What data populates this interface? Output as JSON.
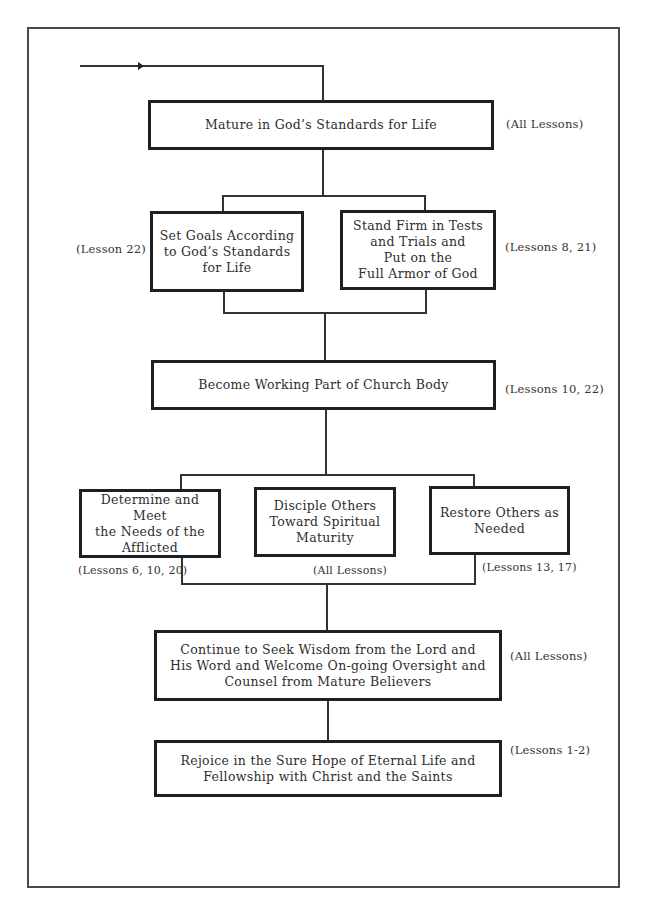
{
  "diagram": {
    "type": "flowchart",
    "entry_arrow": {
      "direction": "right"
    },
    "nodes": [
      {
        "id": "mature",
        "label": "Mature in God’s Standards for Life",
        "lines": [
          "Mature in God’s Standards for Life"
        ],
        "note": "(All Lessons)"
      },
      {
        "id": "set-goals",
        "label": "Set Goals According to God’s Standards for Life",
        "lines": [
          "Set Goals According",
          "to God’s Standards",
          "for Life"
        ],
        "note": "(Lesson 22)"
      },
      {
        "id": "stand-firm",
        "label": "Stand Firm in Tests and Trials and Put on the Full Armor of God",
        "lines": [
          "Stand Firm in Tests",
          "and Trials and",
          "Put on the",
          "Full Armor of God"
        ],
        "note": "(Lessons 8, 21)"
      },
      {
        "id": "church-body",
        "label": "Become Working Part of Church Body",
        "lines": [
          "Become Working Part of Church Body"
        ],
        "note": "(Lessons 10, 22)"
      },
      {
        "id": "afflicted",
        "label": "Determine and Meet the Needs of the Afflicted",
        "lines": [
          "Determine and Meet",
          "the Needs of the",
          "Afflicted"
        ],
        "note": "(Lessons 6, 10, 20)"
      },
      {
        "id": "disciple",
        "label": "Disciple Others Toward Spiritual Maturity",
        "lines": [
          "Disciple Others",
          "Toward Spiritual",
          "Maturity"
        ],
        "note": "(All Lessons)"
      },
      {
        "id": "restore",
        "label": "Restore Others as Needed",
        "lines": [
          "Restore Others as",
          "Needed"
        ],
        "note": "(Lessons 13, 17)"
      },
      {
        "id": "wisdom",
        "label": "Continue to Seek Wisdom from the Lord and His Word and Welcome On-going Oversight and Counsel from Mature Believers",
        "lines": [
          "Continue to Seek Wisdom from the Lord and",
          "His Word and Welcome On-going Oversight and",
          "Counsel from Mature Believers"
        ],
        "note": "(All Lessons)"
      },
      {
        "id": "rejoice",
        "label": "Rejoice in the Sure Hope of Eternal Life and Fellowship with Christ and the Saints",
        "lines": [
          "Rejoice in the Sure Hope of Eternal Life and",
          "Fellowship with Christ and the Saints"
        ],
        "note": "(Lessons 1-2)"
      }
    ],
    "edges": [
      {
        "from": "entry",
        "to": "mature"
      },
      {
        "from": "mature",
        "to": "set-goals"
      },
      {
        "from": "mature",
        "to": "stand-firm"
      },
      {
        "from": "set-goals",
        "to": "church-body"
      },
      {
        "from": "stand-firm",
        "to": "church-body"
      },
      {
        "from": "church-body",
        "to": "afflicted"
      },
      {
        "from": "church-body",
        "to": "disciple"
      },
      {
        "from": "church-body",
        "to": "restore"
      },
      {
        "from": "afflicted",
        "to": "wisdom"
      },
      {
        "from": "disciple",
        "to": "wisdom"
      },
      {
        "from": "restore",
        "to": "wisdom"
      },
      {
        "from": "wisdom",
        "to": "rejoice"
      }
    ]
  }
}
